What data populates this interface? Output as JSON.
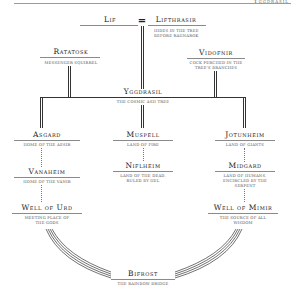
{
  "header": {
    "corner_text": "Yggdrasil"
  },
  "diagram": {
    "nodes": {
      "lif": {
        "name": "Lif"
      },
      "lifthrasir": {
        "name": "Lifthrasir",
        "desc_line1": "Hides in the tree",
        "desc_line2": "before Ragnarok"
      },
      "couple_symbol": "=",
      "ratatosk": {
        "name": "Ratatosk",
        "desc_line1": "Messenger squirrel"
      },
      "vidofnir": {
        "name": "Vidofnir",
        "desc_line1": "Cock perched in the",
        "desc_line2": "tree's branches"
      },
      "yggdrasil": {
        "name": "Yggdrasil",
        "desc_line1": "The cosmic ash tree"
      },
      "asgard": {
        "name": "Asgard",
        "desc_line1": "Home of the Aesir"
      },
      "vanaheim": {
        "name": "Vanaheim",
        "desc_line1": "Home of the Vanir"
      },
      "well_of_urd": {
        "name": "Well of Urd",
        "desc_line1": "Meeting place of",
        "desc_line2": "the gods"
      },
      "muspell": {
        "name": "Muspell",
        "desc_line1": "Land of fire"
      },
      "niflheim": {
        "name": "Niflheim",
        "desc_line1": "Land of the dead,",
        "desc_line2": "ruled by Hel"
      },
      "jotunheim": {
        "name": "Jotunheim",
        "desc_line1": "Land of giants"
      },
      "midgard": {
        "name": "Midgard",
        "desc_line1": "Land of humans,",
        "desc_line2": "encircled by the",
        "desc_line3": "serpent"
      },
      "well_of_mimir": {
        "name": "Well of Mimir",
        "desc_line1": "The source of all",
        "desc_line2": "wisdom"
      },
      "bifrost": {
        "name": "Bifrost",
        "desc_line1": "The rainbow bridge"
      }
    },
    "colors": {
      "line": "#333333",
      "rule": "#8a8a8a",
      "text": "#222222",
      "subtext": "#555555"
    }
  }
}
